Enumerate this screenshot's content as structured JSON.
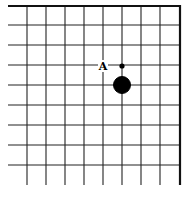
{
  "board": {
    "type": "go-board-fragment",
    "vertical_lines_x": [
      27,
      46,
      65,
      84,
      103,
      122,
      141,
      160
    ],
    "horizontal_lines_y": [
      6,
      25,
      45,
      65,
      85,
      105,
      125,
      145,
      165
    ],
    "left_open_x": 8,
    "bottom_open_y": 185,
    "top_edge": {
      "y": 6,
      "x1": 8,
      "x2": 181
    },
    "right_edge": {
      "x": 180,
      "y1": 6,
      "y2": 185
    },
    "line_color": "#222222",
    "edge_color": "#111111"
  },
  "stones": [
    {
      "color": "black",
      "cx": 122,
      "cy": 85,
      "r": 8.5
    }
  ],
  "markers": [
    {
      "type": "small-dot",
      "cx": 122,
      "cy": 66,
      "r": 2.6
    },
    {
      "type": "label",
      "text": "A",
      "x": 103,
      "y": 66
    }
  ]
}
